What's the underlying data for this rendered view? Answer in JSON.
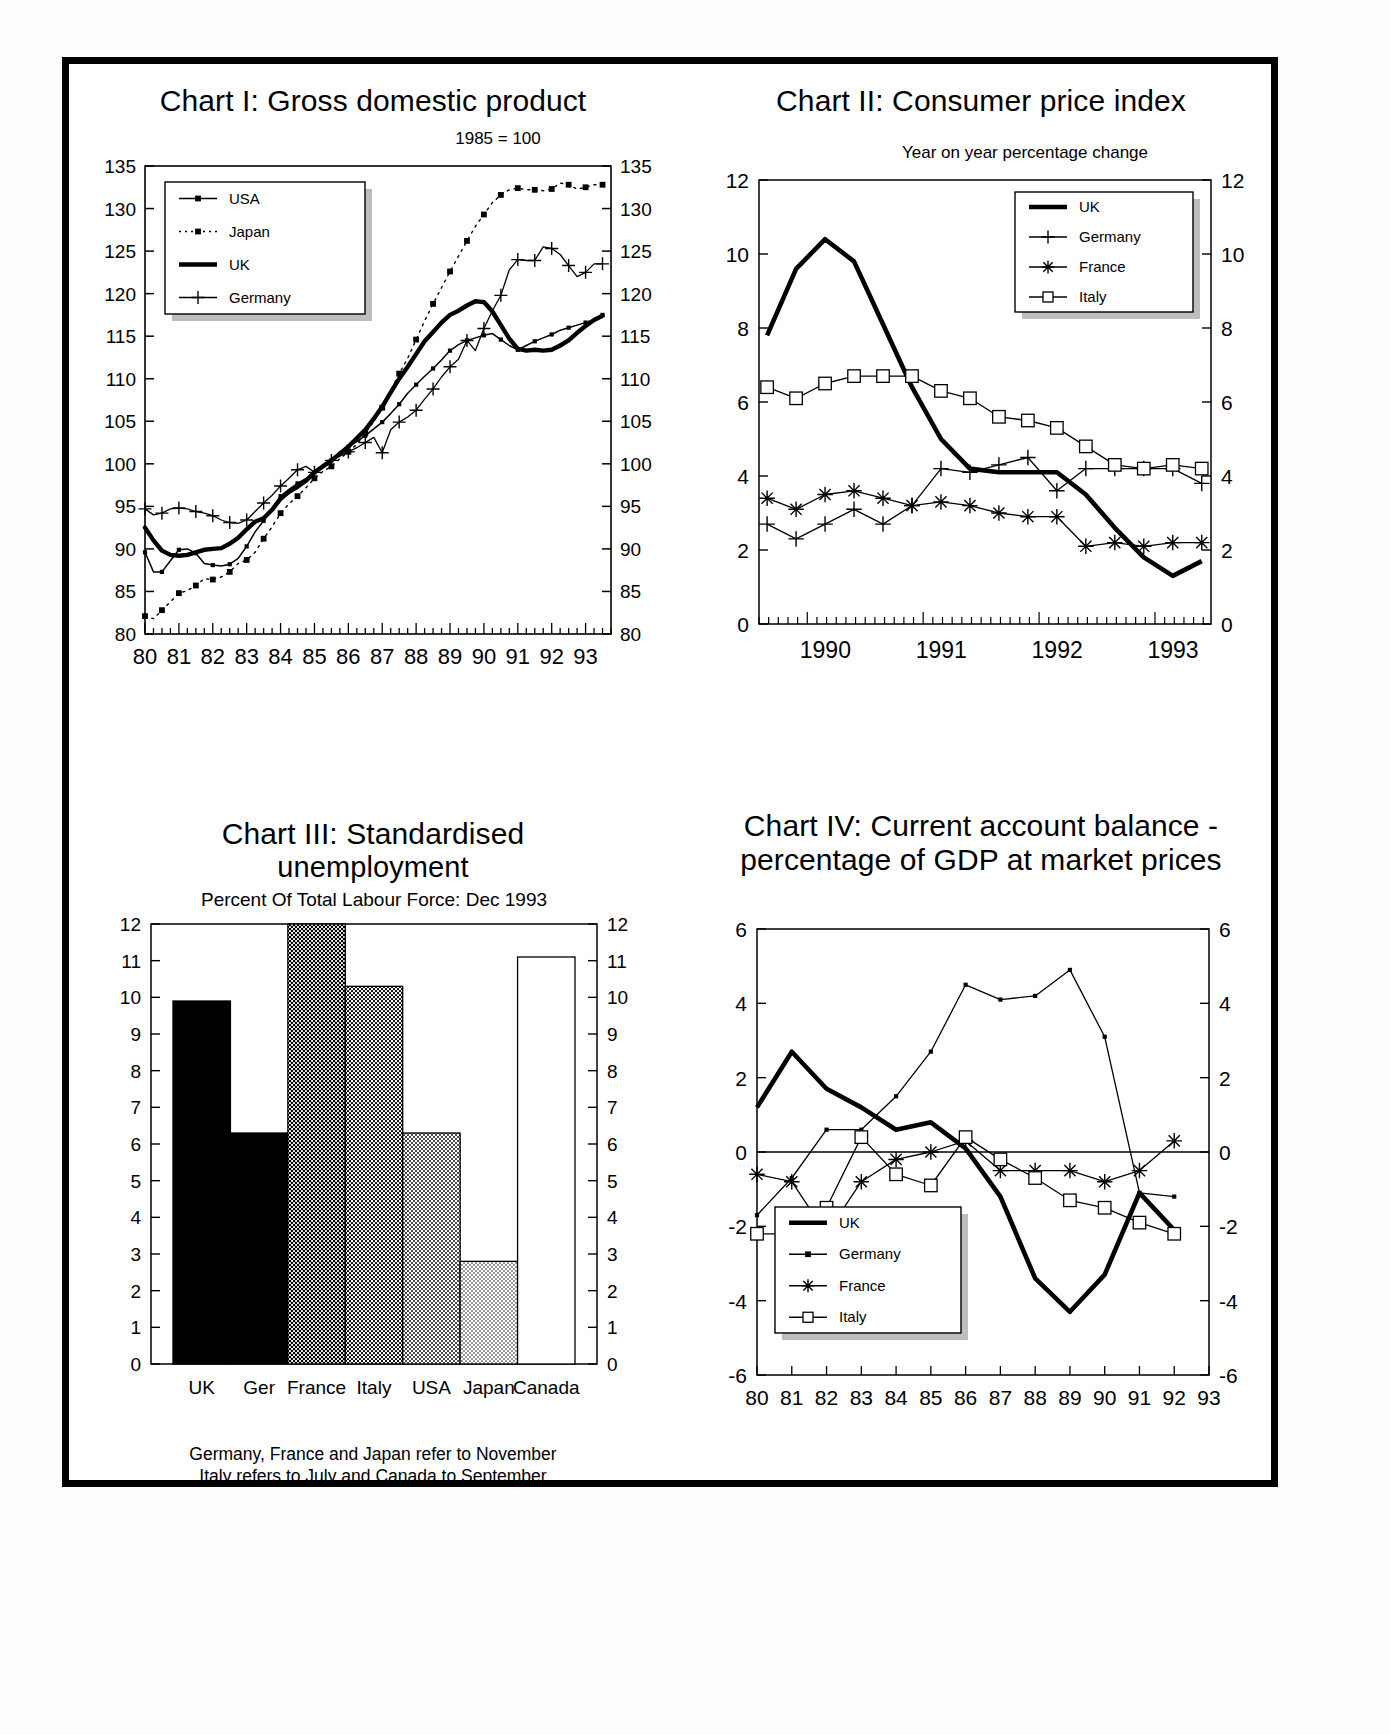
{
  "page": {
    "background": "#ffffff",
    "ink": "#000000"
  },
  "charts": [
    {
      "id": "chart1",
      "title_line1": "Chart I: Gross domestic product",
      "title_line2": "",
      "header_note": "1985 = 100",
      "legend": [
        {
          "label": "USA",
          "marker": "line-dot"
        },
        {
          "label": "Japan",
          "marker": "dotted-square"
        },
        {
          "label": "UK",
          "marker": "thick-line"
        },
        {
          "label": "Germany",
          "marker": "plus"
        }
      ],
      "chart_data": {
        "type": "line",
        "title": "Chart I: Gross domestic product",
        "subtitle": "1985 = 100",
        "xlabel": "",
        "ylabel": "",
        "ylim": [
          80,
          135
        ],
        "yticks": [
          80,
          85,
          90,
          95,
          100,
          105,
          110,
          115,
          120,
          125,
          130,
          135
        ],
        "xlim": [
          1980.0,
          1993.75
        ],
        "xticks": [
          80,
          81,
          82,
          83,
          84,
          85,
          86,
          87,
          88,
          89,
          90,
          91,
          92,
          93
        ],
        "xtick_labels": [
          "80",
          "81",
          "82",
          "83",
          "84",
          "85",
          "86",
          "87",
          "88",
          "89",
          "90",
          "91",
          "92",
          "93"
        ],
        "grid": false,
        "legend_position": "top-left",
        "x": [
          1980.0,
          1980.25,
          1980.5,
          1980.75,
          1981.0,
          1981.25,
          1981.5,
          1981.75,
          1982.0,
          1982.25,
          1982.5,
          1982.75,
          1983.0,
          1983.25,
          1983.5,
          1983.75,
          1984.0,
          1984.25,
          1984.5,
          1984.75,
          1985.0,
          1985.25,
          1985.5,
          1985.75,
          1986.0,
          1986.25,
          1986.5,
          1986.75,
          1987.0,
          1987.25,
          1987.5,
          1987.75,
          1988.0,
          1988.25,
          1988.5,
          1988.75,
          1989.0,
          1989.25,
          1989.5,
          1989.75,
          1990.0,
          1990.25,
          1990.5,
          1990.75,
          1991.0,
          1991.25,
          1991.5,
          1991.75,
          1992.0,
          1992.25,
          1992.5,
          1992.75,
          1993.0,
          1993.25,
          1993.5
        ],
        "series": [
          {
            "name": "USA",
            "values": [
              89.6,
              87.3,
              87.3,
              88.6,
              89.9,
              90.0,
              89.5,
              88.3,
              88.1,
              88.0,
              88.2,
              88.9,
              90.3,
              92.0,
              93.3,
              94.7,
              96.2,
              97.0,
              97.7,
              98.3,
              99.0,
              99.6,
              100.4,
              101.4,
              102.0,
              102.6,
              103.3,
              104.1,
              104.9,
              105.9,
              107.0,
              108.3,
              109.3,
              110.3,
              111.2,
              112.2,
              113.3,
              114.0,
              114.5,
              114.8,
              115.1,
              115.3,
              114.6,
              113.9,
              113.4,
              113.9,
              114.4,
              114.8,
              115.2,
              115.7,
              116.0,
              116.3,
              116.6,
              117.0,
              117.5
            ]
          },
          {
            "name": "Japan",
            "values": [
              82.1,
              81.8,
              82.8,
              83.8,
              84.8,
              85.1,
              85.7,
              86.5,
              86.4,
              86.7,
              87.3,
              88.3,
              88.7,
              89.6,
              91.2,
              92.6,
              94.2,
              95.3,
              96.2,
              97.2,
              98.3,
              99.1,
              99.7,
              100.6,
              101.4,
              102.3,
              103.6,
              105.0,
              106.6,
              108.6,
              110.6,
              112.4,
              114.6,
              116.8,
              118.8,
              120.7,
              122.6,
              124.4,
              126.2,
              127.9,
              129.3,
              130.7,
              131.6,
              132.2,
              132.4,
              132.2,
              132.2,
              132.1,
              132.3,
              133.0,
              132.8,
              132.3,
              132.5,
              132.8,
              132.8
            ]
          },
          {
            "name": "UK",
            "values": [
              92.5,
              91.0,
              89.8,
              89.3,
              89.2,
              89.3,
              89.6,
              89.9,
              90.0,
              90.1,
              90.6,
              91.3,
              92.3,
              93.2,
              93.6,
              94.6,
              95.9,
              96.7,
              97.3,
              98.0,
              99.0,
              99.7,
              100.4,
              101.2,
              102.0,
              103.0,
              104.0,
              105.3,
              106.7,
              108.4,
              110.0,
              111.4,
              112.9,
              114.4,
              115.5,
              116.6,
              117.5,
              118.0,
              118.6,
              119.1,
              119.0,
              117.9,
              116.3,
              114.7,
              113.5,
              113.3,
              113.4,
              113.3,
              113.4,
              113.9,
              114.5,
              115.4,
              116.2,
              116.9,
              117.4
            ]
          },
          {
            "name": "Germany",
            "values": [
              94.7,
              94.0,
              94.2,
              94.7,
              94.8,
              94.7,
              94.4,
              94.2,
              93.9,
              93.4,
              93.1,
              93.0,
              93.4,
              94.4,
              95.4,
              96.3,
              97.4,
              98.3,
              99.3,
              99.7,
              99.0,
              99.6,
              100.4,
              100.9,
              101.4,
              101.9,
              102.5,
              103.1,
              101.3,
              104.0,
              104.9,
              105.5,
              106.3,
              107.6,
              108.8,
              110.2,
              111.4,
              112.3,
              114.5,
              113.3,
              115.9,
              118.0,
              119.8,
              122.8,
              124.0,
              123.9,
              123.9,
              125.5,
              125.3,
              124.6,
              123.3,
              122.0,
              122.5,
              123.5,
              123.5
            ]
          }
        ]
      }
    },
    {
      "id": "chart2",
      "title_line1": "Chart II: Consumer price index",
      "title_line2": "",
      "header_note": "Year on year percentage change",
      "legend": [
        {
          "label": "UK",
          "marker": "thick-line"
        },
        {
          "label": "Germany",
          "marker": "plus"
        },
        {
          "label": "France",
          "marker": "asterisk"
        },
        {
          "label": "Italy",
          "marker": "square"
        }
      ],
      "chart_data": {
        "type": "line",
        "title": "Chart II: Consumer price index",
        "subtitle": "Year on year percentage change",
        "xlabel": "",
        "ylabel": "",
        "ylim": [
          0,
          12
        ],
        "yticks": [
          0,
          2,
          4,
          6,
          8,
          10,
          12
        ],
        "xlim": [
          1989.6,
          1993.5
        ],
        "xticks": [
          1990,
          1991,
          1992,
          1993
        ],
        "xtick_labels": [
          "1990",
          "1991",
          "1992",
          "1993"
        ],
        "grid": false,
        "legend_position": "top-right",
        "x": [
          1989.67,
          1989.92,
          1990.17,
          1990.42,
          1990.67,
          1990.92,
          1991.17,
          1991.42,
          1991.67,
          1991.92,
          1992.17,
          1992.42,
          1992.67,
          1992.92,
          1993.17,
          1993.42
        ],
        "series": [
          {
            "name": "UK",
            "values": [
              7.8,
              9.6,
              10.4,
              9.8,
              8.1,
              6.4,
              5.0,
              4.2,
              4.1,
              4.1,
              4.1,
              3.5,
              2.6,
              1.8,
              1.3,
              1.7
            ]
          },
          {
            "name": "Germany",
            "values": [
              2.7,
              2.3,
              2.7,
              3.1,
              2.7,
              3.2,
              4.2,
              4.1,
              4.3,
              4.5,
              3.6,
              4.2,
              4.2,
              4.2,
              4.2,
              3.8
            ]
          },
          {
            "name": "France",
            "values": [
              3.4,
              3.1,
              3.5,
              3.6,
              3.4,
              3.2,
              3.3,
              3.2,
              3.0,
              2.9,
              2.9,
              2.1,
              2.2,
              2.1,
              2.2,
              2.2
            ]
          },
          {
            "name": "Italy",
            "values": [
              6.4,
              6.1,
              6.5,
              6.7,
              6.7,
              6.7,
              6.3,
              6.1,
              5.6,
              5.5,
              5.3,
              4.8,
              4.3,
              4.2,
              4.3,
              4.2
            ]
          }
        ]
      }
    },
    {
      "id": "chart3",
      "title_line1": "Chart III: Standardised",
      "title_line2": "unemployment",
      "header_note": "Percent Of Total Labour Force: Dec 1993",
      "footnote_line1": "Germany, France and Japan refer to November",
      "footnote_line2": "Italy refers to July and Canada to September",
      "chart_data": {
        "type": "bar",
        "title": "Chart III: Standardised unemployment",
        "subtitle": "Percent Of Total Labour Force: Dec 1993",
        "categories": [
          "UK",
          "Ger",
          "France",
          "Italy",
          "USA",
          "Japan",
          "Canada"
        ],
        "values": [
          9.9,
          6.3,
          12.0,
          10.3,
          6.3,
          2.8,
          11.1
        ],
        "xlabel": "",
        "ylabel": "",
        "ylim": [
          0,
          12
        ],
        "yticks": [
          0,
          1,
          2,
          3,
          4,
          5,
          6,
          7,
          8,
          9,
          10,
          11,
          12
        ],
        "grid": false,
        "fills": [
          "#0d0d0d",
          "#3a3a3a",
          "#707070",
          "#8f8f8f",
          "#b0b0b0",
          "#d4d4d4",
          "#ffffff"
        ],
        "notes": "France bar reaches or exceeds top of axis (12)"
      }
    },
    {
      "id": "chart4",
      "title_line1": "Chart IV: Current account balance -",
      "title_line2": "percentage of GDP at market prices",
      "header_note": "",
      "legend": [
        {
          "label": "UK",
          "marker": "thick-line"
        },
        {
          "label": "Germany",
          "marker": "line-dot"
        },
        {
          "label": "France",
          "marker": "asterisk"
        },
        {
          "label": "Italy",
          "marker": "square"
        }
      ],
      "chart_data": {
        "type": "line",
        "title": "Chart IV: Current account balance - percentage of GDP at market prices",
        "xlabel": "",
        "ylabel": "",
        "ylim": [
          -6,
          6
        ],
        "yticks": [
          -6,
          -4,
          -2,
          0,
          2,
          4,
          6
        ],
        "xlim": [
          1980,
          1993
        ],
        "xticks": [
          80,
          81,
          82,
          83,
          84,
          85,
          86,
          87,
          88,
          89,
          90,
          91,
          92,
          93
        ],
        "xtick_labels": [
          "80",
          "81",
          "82",
          "83",
          "84",
          "85",
          "86",
          "87",
          "88",
          "89",
          "90",
          "91",
          "92",
          "93"
        ],
        "grid": false,
        "zero_line": true,
        "legend_position": "bottom-left",
        "x": [
          1980,
          1981,
          1982,
          1983,
          1984,
          1985,
          1986,
          1987,
          1988,
          1989,
          1990,
          1991,
          1992
        ],
        "series": [
          {
            "name": "UK",
            "values": [
              1.2,
              2.7,
              1.7,
              1.2,
              0.6,
              0.8,
              0.1,
              -1.2,
              -3.4,
              -4.3,
              -3.3,
              -1.1,
              -2.1
            ]
          },
          {
            "name": "Germany",
            "values": [
              -1.7,
              -0.7,
              0.6,
              0.6,
              1.5,
              2.7,
              4.5,
              4.1,
              4.2,
              4.9,
              3.1,
              -1.1,
              -1.2
            ]
          },
          {
            "name": "France",
            "values": [
              -0.6,
              -0.8,
              -2.2,
              -0.8,
              -0.2,
              0.0,
              0.3,
              -0.5,
              -0.5,
              -0.5,
              -0.8,
              -0.5,
              0.3
            ]
          },
          {
            "name": "Italy",
            "values": [
              -2.2,
              -2.2,
              -1.5,
              0.4,
              -0.6,
              -0.9,
              0.4,
              -0.2,
              -0.7,
              -1.3,
              -1.5,
              -1.9,
              -2.2
            ]
          }
        ]
      }
    }
  ]
}
